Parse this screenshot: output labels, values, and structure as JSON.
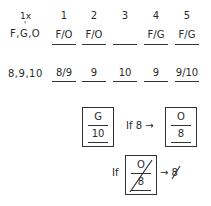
{
  "header": {
    "multiplier_label": "1x",
    "columns": [
      "1",
      "2",
      "3",
      "4",
      "5"
    ]
  },
  "rows": [
    {
      "label": "F,G,O",
      "cells": [
        "F/O",
        "F/O",
        "",
        "F/G",
        "F/G"
      ]
    },
    {
      "label": "8,9,10",
      "cells": [
        "8/9",
        "9",
        "10",
        "9",
        "9/10"
      ]
    }
  ],
  "notes": {
    "box1": {
      "top": "G",
      "bottom": "10"
    },
    "condition1": "If 8 →",
    "box2": {
      "top": "O",
      "bottom": "8"
    },
    "condition2_prefix": "If",
    "box3": {
      "top": "O",
      "bottom": "8",
      "crossed": true
    },
    "result": "→ 8",
    "result_crossed": true
  }
}
